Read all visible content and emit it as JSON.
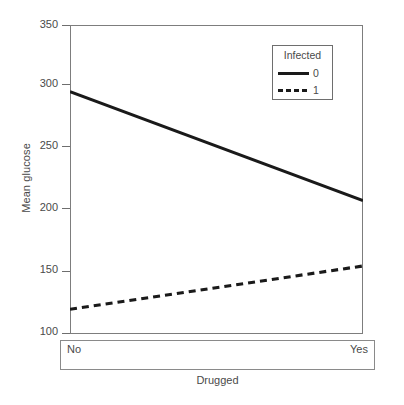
{
  "chart_data": {
    "type": "line",
    "title": "",
    "xlabel": "Drugged",
    "ylabel": "Mean glucose",
    "categories": [
      "No",
      "Yes"
    ],
    "ylim": [
      100,
      350
    ],
    "yticks": [
      100,
      150,
      200,
      250,
      300,
      350
    ],
    "ytick_labels": [
      "100",
      "150",
      "200",
      "250",
      "300",
      "350"
    ],
    "grid": false,
    "legend_position": "top-right",
    "legend_title": "Infected",
    "series": [
      {
        "name": "0",
        "style": "solid",
        "values": [
          296,
          208
        ]
      },
      {
        "name": "1",
        "style": "dashed",
        "values": [
          120,
          155
        ]
      }
    ]
  },
  "axes": {
    "y_title": "Mean glucose",
    "x_title": "Drugged",
    "x_categories": {
      "first": "No",
      "second": "Yes"
    },
    "y_labels": {
      "t350": "350",
      "t300": "300",
      "t250": "250",
      "t200": "200",
      "t150": "150",
      "t100": "100"
    }
  },
  "legend": {
    "title": "Infected",
    "entries": [
      {
        "label": "0"
      },
      {
        "label": "1"
      }
    ]
  },
  "colors": {
    "line": "#1a1a1a",
    "axis": "#6e6e6e",
    "text": "#4a4a4a",
    "background": "#ffffff"
  }
}
